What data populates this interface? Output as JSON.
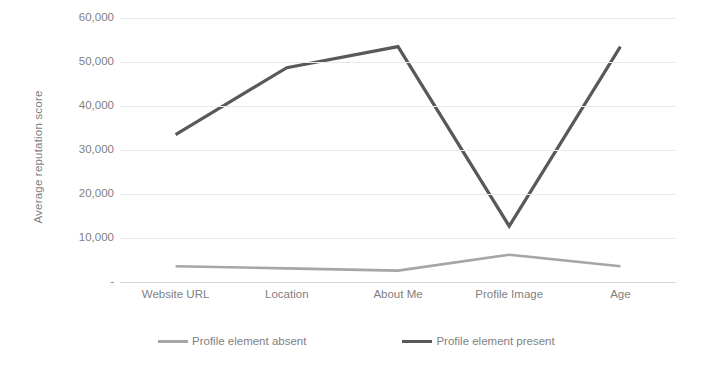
{
  "chart_data": {
    "type": "line",
    "title": "",
    "xlabel": "",
    "ylabel": "Average reputation score",
    "categories": [
      "Website URL",
      "Location",
      "About Me",
      "Profile Image",
      "Age"
    ],
    "ylim": [
      0,
      60000
    ],
    "yticks": [
      "-",
      "10,000",
      "20,000",
      "30,000",
      "40,000",
      "50,000",
      "60,000"
    ],
    "ytick_values": [
      0,
      10000,
      20000,
      30000,
      40000,
      50000,
      60000
    ],
    "grid": true,
    "legend_position": "bottom",
    "series": [
      {
        "name": "Profile element absent",
        "color": "#a6a6a6",
        "values": [
          3600,
          3100,
          2600,
          6200,
          3600
        ]
      },
      {
        "name": "Profile element present",
        "color": "#595959",
        "values": [
          33500,
          48700,
          53500,
          12700,
          53500
        ]
      }
    ]
  },
  "legend": {
    "items": [
      {
        "label": "Profile element absent",
        "color": "#a6a6a6"
      },
      {
        "label": "Profile element present",
        "color": "#595959"
      }
    ]
  }
}
